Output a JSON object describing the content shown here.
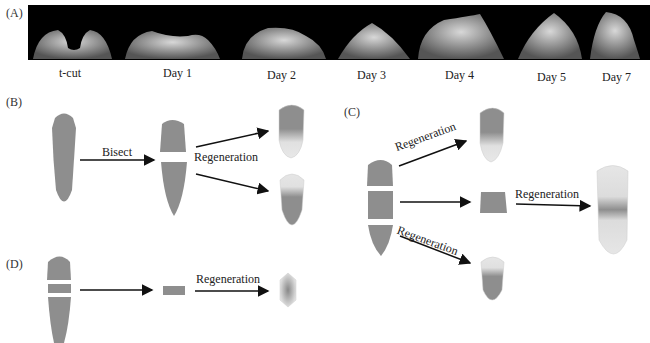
{
  "panels": {
    "A": {
      "label": "(A)",
      "timepoints": [
        "t-cut",
        "Day 1",
        "Day 2",
        "Day 3",
        "Day 4",
        "Day 5",
        "Day 7"
      ]
    },
    "B": {
      "label": "(B)",
      "arrow_bisect": "Bisect",
      "arrow_regeneration": "Regeneration"
    },
    "C": {
      "label": "(C)",
      "arrow_top": "Regeneration",
      "arrow_middle": "Regeneration",
      "arrow_bottom": "Regeneration"
    },
    "D": {
      "label": "(D)",
      "arrow_regeneration": "Regeneration"
    }
  },
  "colors": {
    "body": "#8e8e8e",
    "light": "#e2e2e2",
    "background": "#ffffff",
    "photo_bg": "#000000"
  }
}
